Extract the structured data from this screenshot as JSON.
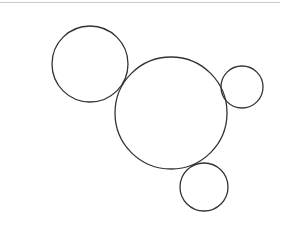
{
  "canvas": {
    "width": 281,
    "height": 228,
    "background": "#ffffff"
  },
  "top_rule": {
    "color": "#c8c8c8"
  },
  "stroke_color": "#333333",
  "circles": [
    {
      "name": "circle-top-left",
      "cx": 90,
      "cy": 64,
      "r": 38
    },
    {
      "name": "circle-center-large",
      "cx": 171,
      "cy": 113,
      "r": 56
    },
    {
      "name": "circle-right-small",
      "cx": 242,
      "cy": 87,
      "r": 21
    },
    {
      "name": "circle-bottom-small",
      "cx": 204,
      "cy": 187,
      "r": 24
    }
  ]
}
